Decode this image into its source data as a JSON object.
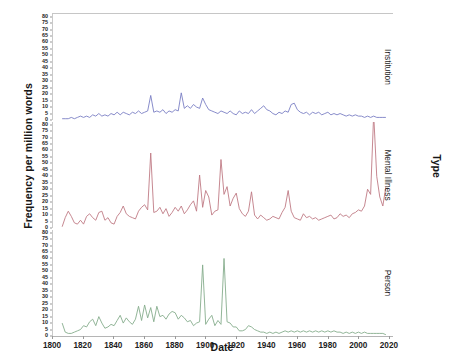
{
  "chart_data": {
    "type": "line",
    "title": "",
    "xlabel": "Date",
    "ylabel": "Frequency per million words",
    "strip_label": "Type",
    "grid": false,
    "legend_position": "right-strip",
    "xlim": [
      1800,
      2022
    ],
    "ylim": [
      0,
      82
    ],
    "xticks": [
      1800,
      1820,
      1840,
      1860,
      1880,
      1900,
      1920,
      1940,
      1960,
      1980,
      2000,
      2020
    ],
    "yticks": [
      0,
      5,
      10,
      15,
      20,
      25,
      30,
      35,
      40,
      45,
      50,
      55,
      60,
      65,
      70,
      75,
      80
    ],
    "colors": {
      "institution": "#7b7fc4",
      "mental_illness": "#c07b84",
      "person": "#86ad8c",
      "axis": "#b5b5b5",
      "text": "#1d1d1d"
    },
    "panels": [
      {
        "name": "institution",
        "label": "Institution",
        "color": "#7b7fc4",
        "x": [
          1806,
          1808,
          1810,
          1812,
          1814,
          1816,
          1818,
          1820,
          1822,
          1824,
          1826,
          1828,
          1830,
          1832,
          1834,
          1836,
          1838,
          1840,
          1842,
          1844,
          1846,
          1848,
          1850,
          1852,
          1854,
          1856,
          1858,
          1860,
          1862,
          1864,
          1866,
          1868,
          1870,
          1872,
          1874,
          1876,
          1878,
          1880,
          1882,
          1884,
          1886,
          1888,
          1890,
          1892,
          1894,
          1896,
          1898,
          1900,
          1902,
          1904,
          1906,
          1908,
          1910,
          1912,
          1914,
          1916,
          1918,
          1920,
          1922,
          1924,
          1926,
          1928,
          1930,
          1932,
          1934,
          1936,
          1938,
          1940,
          1942,
          1944,
          1946,
          1948,
          1950,
          1952,
          1954,
          1956,
          1958,
          1960,
          1962,
          1964,
          1966,
          1968,
          1970,
          1972,
          1974,
          1976,
          1978,
          1980,
          1982,
          1984,
          1986,
          1988,
          1990,
          1992,
          1994,
          1996,
          1998,
          2000,
          2002,
          2004,
          2006,
          2008,
          2010,
          2012,
          2014,
          2016,
          2018
        ],
        "y": [
          1,
          1,
          1,
          2,
          1,
          2,
          3,
          2,
          3,
          2,
          4,
          3,
          5,
          3,
          4,
          3,
          5,
          4,
          6,
          4,
          6,
          5,
          4,
          6,
          5,
          7,
          5,
          6,
          7,
          19,
          6,
          7,
          6,
          8,
          5,
          7,
          6,
          8,
          7,
          21,
          9,
          11,
          9,
          12,
          10,
          9,
          17,
          12,
          8,
          7,
          6,
          5,
          7,
          6,
          5,
          7,
          5,
          4,
          7,
          5,
          6,
          5,
          8,
          5,
          7,
          9,
          11,
          8,
          7,
          5,
          4,
          6,
          5,
          7,
          6,
          12,
          13,
          8,
          6,
          5,
          6,
          4,
          6,
          5,
          6,
          4,
          5,
          6,
          4,
          5,
          4,
          5,
          4,
          3,
          4,
          3,
          4,
          3,
          3,
          2,
          3,
          2,
          3,
          2,
          2,
          2,
          2
        ]
      },
      {
        "name": "mental_illness",
        "label": "Mental Illness",
        "color": "#c07b84",
        "x": [
          1806,
          1808,
          1810,
          1812,
          1814,
          1816,
          1818,
          1820,
          1822,
          1824,
          1826,
          1828,
          1830,
          1832,
          1834,
          1836,
          1838,
          1840,
          1842,
          1844,
          1846,
          1848,
          1850,
          1852,
          1854,
          1856,
          1858,
          1860,
          1862,
          1864,
          1866,
          1868,
          1870,
          1872,
          1874,
          1876,
          1878,
          1880,
          1882,
          1884,
          1886,
          1888,
          1890,
          1892,
          1894,
          1896,
          1898,
          1900,
          1902,
          1904,
          1906,
          1908,
          1910,
          1912,
          1914,
          1916,
          1918,
          1920,
          1922,
          1924,
          1926,
          1928,
          1930,
          1932,
          1934,
          1936,
          1938,
          1940,
          1942,
          1944,
          1946,
          1948,
          1950,
          1952,
          1954,
          1956,
          1958,
          1960,
          1962,
          1964,
          1966,
          1968,
          1970,
          1972,
          1974,
          1976,
          1978,
          1980,
          1982,
          1984,
          1986,
          1988,
          1990,
          1992,
          1994,
          1996,
          1998,
          2000,
          2002,
          2004,
          2006,
          2008,
          2010,
          2012,
          2014,
          2016,
          2018
        ],
        "y": [
          1,
          8,
          13,
          9,
          4,
          3,
          6,
          3,
          9,
          11,
          8,
          6,
          12,
          13,
          6,
          8,
          4,
          3,
          9,
          12,
          17,
          11,
          9,
          8,
          7,
          13,
          16,
          18,
          14,
          58,
          12,
          13,
          16,
          11,
          15,
          9,
          12,
          16,
          13,
          17,
          11,
          14,
          18,
          21,
          13,
          41,
          16,
          29,
          24,
          10,
          13,
          14,
          53,
          26,
          32,
          17,
          23,
          27,
          15,
          11,
          9,
          13,
          28,
          10,
          7,
          10,
          8,
          6,
          7,
          9,
          8,
          7,
          12,
          16,
          29,
          13,
          8,
          7,
          6,
          11,
          8,
          9,
          7,
          8,
          6,
          7,
          8,
          9,
          10,
          7,
          8,
          11,
          9,
          10,
          8,
          11,
          12,
          14,
          13,
          17,
          30,
          26,
          88,
          40,
          24,
          17,
          32
        ]
      },
      {
        "name": "person",
        "label": "Person",
        "color": "#86ad8c",
        "x": [
          1806,
          1808,
          1810,
          1812,
          1814,
          1816,
          1818,
          1820,
          1822,
          1824,
          1826,
          1828,
          1830,
          1832,
          1834,
          1836,
          1838,
          1840,
          1842,
          1844,
          1846,
          1848,
          1850,
          1852,
          1854,
          1856,
          1858,
          1860,
          1862,
          1864,
          1866,
          1868,
          1870,
          1872,
          1874,
          1876,
          1878,
          1880,
          1882,
          1884,
          1886,
          1888,
          1890,
          1892,
          1894,
          1896,
          1898,
          1900,
          1902,
          1904,
          1906,
          1908,
          1910,
          1912,
          1914,
          1916,
          1918,
          1920,
          1922,
          1924,
          1926,
          1928,
          1930,
          1932,
          1934,
          1936,
          1938,
          1940,
          1942,
          1944,
          1946,
          1948,
          1950,
          1952,
          1954,
          1956,
          1958,
          1960,
          1962,
          1964,
          1966,
          1968,
          1970,
          1972,
          1974,
          1976,
          1978,
          1980,
          1982,
          1984,
          1986,
          1988,
          1990,
          1992,
          1994,
          1996,
          1998,
          2000,
          2002,
          2004,
          2006,
          2008,
          2010,
          2012,
          2014,
          2016,
          2018
        ],
        "y": [
          10,
          3,
          2,
          2,
          3,
          4,
          5,
          8,
          7,
          11,
          13,
          8,
          15,
          10,
          6,
          7,
          9,
          8,
          12,
          16,
          10,
          14,
          11,
          9,
          13,
          23,
          12,
          24,
          14,
          22,
          11,
          23,
          15,
          16,
          13,
          17,
          19,
          18,
          13,
          16,
          14,
          11,
          12,
          8,
          10,
          11,
          55,
          9,
          13,
          16,
          8,
          12,
          9,
          60,
          11,
          10,
          7,
          7,
          4,
          4,
          5,
          8,
          7,
          5,
          4,
          3,
          3,
          2,
          3,
          2,
          3,
          2,
          3,
          4,
          3,
          4,
          3,
          4,
          3,
          4,
          3,
          4,
          3,
          4,
          3,
          4,
          3,
          4,
          3,
          4,
          3,
          3,
          2,
          3,
          2,
          3,
          2,
          3,
          2,
          3,
          2,
          2,
          2,
          2,
          2,
          2,
          1
        ]
      }
    ]
  }
}
